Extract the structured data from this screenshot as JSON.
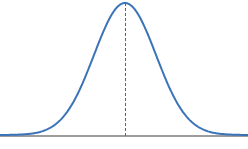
{
  "figure": {
    "width": 248,
    "height": 149,
    "background_color": "#ffffff",
    "title": "",
    "caption": ""
  },
  "style": {
    "curve_color": "#3b73b9",
    "curve_width": 2,
    "axis_color": "#9c9c9c",
    "axis_width": 2,
    "mean_line_color": "#6b6257",
    "mean_line_width": 1,
    "mean_line_dash": "3 2"
  },
  "geometry": {
    "baseline_y": 135,
    "peak_x": 125,
    "peak_y": 3,
    "sigma_px": 31,
    "x_start": 0,
    "x_end": 248
  },
  "annotations": {
    "mean_line_label": "mean",
    "axis_label": "x-axis"
  },
  "chart_data": {
    "type": "line",
    "subtitle": "",
    "xlabel": "",
    "ylabel": "",
    "grid": false,
    "legend": false,
    "legend_position": "none",
    "distribution": "normal",
    "mean": 0,
    "std_dev": 1,
    "xlim": [
      -4.03,
      3.97
    ],
    "ylim": [
      0,
      1
    ],
    "xticks": [],
    "yticks": [],
    "xticklabels": [],
    "yticklabels": [],
    "annotations": [
      {
        "type": "vline",
        "x": 0,
        "label": "mean",
        "style": "dashed",
        "from_y": 0,
        "to_y": 1
      }
    ],
    "series": [
      {
        "name": "Normal PDF",
        "color": "#3b73b9",
        "x": [
          -4.03,
          -3.71,
          -3.39,
          -3.06,
          -2.74,
          -2.42,
          -2.1,
          -1.77,
          -1.45,
          -1.13,
          -0.81,
          -0.48,
          -0.16,
          0.0,
          0.16,
          0.48,
          0.81,
          1.13,
          1.45,
          1.77,
          2.1,
          2.42,
          2.74,
          3.06,
          3.39,
          3.71,
          3.97
        ],
        "y": [
          0.0002,
          0.001,
          0.0033,
          0.0094,
          0.0235,
          0.0546,
          0.1103,
          0.2055,
          0.3493,
          0.5288,
          0.7203,
          0.8915,
          0.9873,
          1.0,
          0.9873,
          0.8915,
          0.7203,
          0.5288,
          0.3493,
          0.2055,
          0.1103,
          0.0546,
          0.0235,
          0.0094,
          0.0033,
          0.001,
          0.0004
        ]
      }
    ]
  }
}
